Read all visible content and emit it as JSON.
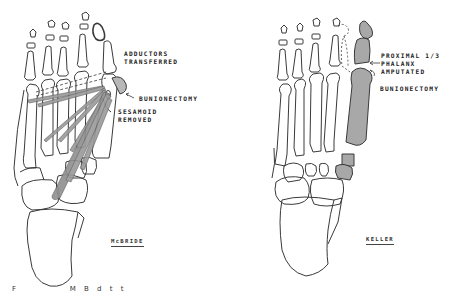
{
  "figure": {
    "panels": [
      {
        "id": "mcbride",
        "title": "McBRIDE",
        "labels": {
          "adductors": "ADDUCTORS\nTRANSFERRED",
          "bunionectomy": "BUNIONECTOMY",
          "sesamoid": "SESAMOID\nREMOVED"
        }
      },
      {
        "id": "keller",
        "title": "KELLER",
        "labels": {
          "amputated": "PROXIMAL 1/3\nPHALANX\nAMPUTATED",
          "bunionectomy": "BUNIONECTOMY"
        }
      }
    ],
    "caption": "F        M B   d   t   t"
  },
  "colors": {
    "line": "#3a3a3a",
    "shade": "#a8a8a8",
    "background": "#ffffff"
  }
}
